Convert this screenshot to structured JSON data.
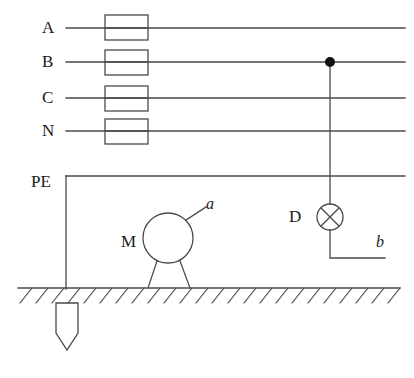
{
  "diagram": {
    "colors": {
      "line": "#4a4a4a",
      "node": "#111111",
      "text": "#1a1a1a",
      "background": "#ffffff"
    },
    "phase_lines": [
      {
        "label": "A",
        "y": 28,
        "has_fuse": true
      },
      {
        "label": "B",
        "y": 62,
        "has_fuse": true
      },
      {
        "label": "C",
        "y": 98,
        "has_fuse": true
      },
      {
        "label": "N",
        "y": 131,
        "has_fuse": true
      }
    ],
    "protective_earth": {
      "label": "PE",
      "y": 176
    },
    "junction": {
      "name": "tap-on-phase-b",
      "x": 330,
      "y": 62
    },
    "motor": {
      "label": "M",
      "fault_label": "a",
      "center_x": 168,
      "center_y": 238,
      "radius": 25
    },
    "lamp": {
      "label": "D",
      "fault_label": "b",
      "center_x": 330,
      "center_y": 217,
      "radius": 13
    },
    "earth_electrode": {
      "name": "earth-rod",
      "x": 67,
      "top": 303,
      "bottom": 350
    },
    "ground": {
      "y": 288,
      "x_start": 18,
      "x_end": 400
    }
  }
}
